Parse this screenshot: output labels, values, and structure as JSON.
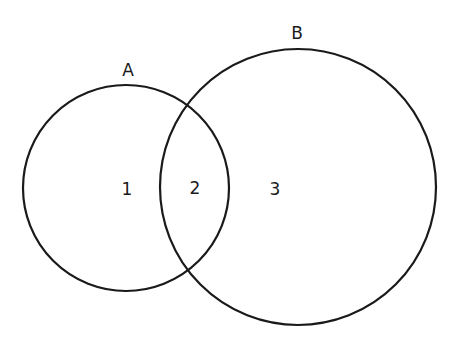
{
  "diagram": {
    "type": "venn",
    "sets": [
      {
        "id": "A",
        "label": "A",
        "cx": 126,
        "cy": 188,
        "r": 103,
        "label_x": 128,
        "label_y": 76
      },
      {
        "id": "B",
        "label": "B",
        "cx": 298,
        "cy": 187,
        "r": 138,
        "label_x": 297,
        "label_y": 39
      }
    ],
    "regions": [
      {
        "id": "1",
        "label": "1",
        "x": 127,
        "y": 195,
        "description": "A only"
      },
      {
        "id": "2",
        "label": "2",
        "x": 195,
        "y": 194,
        "description": "A and B"
      },
      {
        "id": "3",
        "label": "3",
        "x": 275,
        "y": 195,
        "description": "B only"
      }
    ],
    "stroke_color": "#1a1a1a"
  }
}
